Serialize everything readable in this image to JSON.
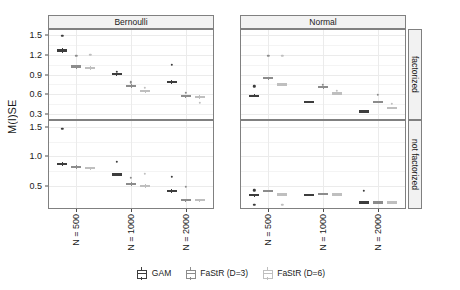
{
  "chart_data": {
    "type": "box",
    "title": "",
    "xlabel": "",
    "ylabel": "M(I)SE",
    "grid": true,
    "legend_position": "bottom",
    "facet_cols": [
      "Bernoulli",
      "Normal"
    ],
    "facet_rows": [
      "factorized",
      "not factorized"
    ],
    "categories": [
      "N = 500",
      "N = 1000",
      "N = 2000"
    ],
    "series": [
      {
        "name": "GAM",
        "color": "#3d3d3d"
      },
      {
        "name": "FaStR (D=3)",
        "color": "#8c8c8c"
      },
      {
        "name": "FaStR (D=6)",
        "color": "#bfbfbf"
      }
    ],
    "panels": [
      {
        "facet_col": "Bernoulli",
        "facet_row": "factorized",
        "ylim": [
          0.22,
          1.58
        ],
        "yticks": [
          0.3,
          0.6,
          0.9,
          1.2,
          1.5
        ],
        "ytick_labels": [
          "0.3",
          "0.6",
          "0.9",
          "1.2",
          "1.5"
        ],
        "boxes": [
          {
            "category": "N = 500",
            "series": "GAM",
            "q1": 1.25,
            "median": 1.27,
            "q3": 1.29,
            "lower": 1.24,
            "upper": 1.3,
            "outliers": [
              1.49
            ]
          },
          {
            "category": "N = 500",
            "series": "FaStR (D=3)",
            "q1": 1.0,
            "median": 1.02,
            "q3": 1.04,
            "lower": 0.99,
            "upper": 1.05,
            "outliers": [
              1.19
            ]
          },
          {
            "category": "N = 500",
            "series": "FaStR (D=6)",
            "q1": 0.99,
            "median": 1.0,
            "q3": 1.02,
            "lower": 0.98,
            "upper": 1.03,
            "outliers": [
              1.2
            ]
          },
          {
            "category": "N = 1000",
            "series": "GAM",
            "q1": 0.89,
            "median": 0.905,
            "q3": 0.92,
            "lower": 0.88,
            "upper": 0.93,
            "outliers": [
              0.94
            ]
          },
          {
            "category": "N = 1000",
            "series": "FaStR (D=3)",
            "q1": 0.715,
            "median": 0.73,
            "q3": 0.745,
            "lower": 0.71,
            "upper": 0.75,
            "outliers": [
              0.78
            ]
          },
          {
            "category": "N = 1000",
            "series": "FaStR (D=6)",
            "q1": 0.635,
            "median": 0.65,
            "q3": 0.665,
            "lower": 0.63,
            "upper": 0.67,
            "outliers": [
              0.7
            ]
          },
          {
            "category": "N = 2000",
            "series": "GAM",
            "q1": 0.77,
            "median": 0.785,
            "q3": 0.8,
            "lower": 0.76,
            "upper": 0.81,
            "outliers": [
              1.05
            ]
          },
          {
            "category": "N = 2000",
            "series": "FaStR (D=3)",
            "q1": 0.55,
            "median": 0.565,
            "q3": 0.58,
            "lower": 0.54,
            "upper": 0.59,
            "outliers": [
              0.62
            ]
          },
          {
            "category": "N = 2000",
            "series": "FaStR (D=6)",
            "q1": 0.545,
            "median": 0.56,
            "q3": 0.575,
            "lower": 0.54,
            "upper": 0.58,
            "outliers": [
              0.47
            ]
          }
        ]
      },
      {
        "facet_col": "Normal",
        "facet_row": "factorized",
        "ylim": [
          0.22,
          1.58
        ],
        "yticks": [
          0.3,
          0.6,
          0.9,
          1.2,
          1.5
        ],
        "ytick_labels": [
          "0.3",
          "0.6",
          "0.9",
          "1.2",
          "1.5"
        ],
        "boxes": [
          {
            "category": "N = 500",
            "series": "GAM",
            "q1": 0.565,
            "median": 0.575,
            "q3": 0.59,
            "lower": 0.555,
            "upper": 0.6,
            "outliers": [
              0.72
            ]
          },
          {
            "category": "N = 500",
            "series": "FaStR (D=3)",
            "q1": 0.825,
            "median": 0.84,
            "q3": 0.855,
            "lower": 0.82,
            "upper": 0.865,
            "outliers": [
              1.185
            ]
          },
          {
            "category": "N = 500",
            "series": "FaStR (D=6)",
            "q1": 0.74,
            "median": 0.75,
            "q3": 0.76,
            "lower": 0.735,
            "upper": 0.77,
            "outliers": [
              1.185
            ]
          },
          {
            "category": "N = 1000",
            "series": "GAM",
            "q1": 0.475,
            "median": 0.485,
            "q3": 0.495,
            "lower": 0.465,
            "upper": 0.5,
            "outliers": []
          },
          {
            "category": "N = 1000",
            "series": "FaStR (D=3)",
            "q1": 0.7,
            "median": 0.71,
            "q3": 0.72,
            "lower": 0.695,
            "upper": 0.725,
            "outliers": [
              0.74
            ]
          },
          {
            "category": "N = 1000",
            "series": "FaStR (D=6)",
            "q1": 0.6,
            "median": 0.61,
            "q3": 0.62,
            "lower": 0.595,
            "upper": 0.625,
            "outliers": [
              0.65
            ]
          },
          {
            "category": "N = 2000",
            "series": "GAM",
            "q1": 0.325,
            "median": 0.335,
            "q3": 0.345,
            "lower": 0.32,
            "upper": 0.35,
            "outliers": []
          },
          {
            "category": "N = 2000",
            "series": "FaStR (D=3)",
            "q1": 0.475,
            "median": 0.485,
            "q3": 0.495,
            "lower": 0.47,
            "upper": 0.5,
            "outliers": [
              0.59
            ]
          },
          {
            "category": "N = 2000",
            "series": "FaStR (D=6)",
            "q1": 0.385,
            "median": 0.395,
            "q3": 0.405,
            "lower": 0.38,
            "upper": 0.41,
            "outliers": [
              0.45
            ]
          }
        ]
      },
      {
        "facet_col": "Bernoulli",
        "facet_row": "not factorized",
        "ylim": [
          0.12,
          1.6
        ],
        "yticks": [
          0.5,
          1.0,
          1.5
        ],
        "ytick_labels": [
          "0.5",
          "1.0",
          "1.5"
        ],
        "boxes": [
          {
            "category": "N = 500",
            "series": "GAM",
            "q1": 0.86,
            "median": 0.875,
            "q3": 0.89,
            "lower": 0.85,
            "upper": 0.9,
            "outliers": [
              1.47
            ]
          },
          {
            "category": "N = 500",
            "series": "FaStR (D=3)",
            "q1": 0.8,
            "median": 0.815,
            "q3": 0.83,
            "lower": 0.79,
            "upper": 0.845,
            "outliers": []
          },
          {
            "category": "N = 500",
            "series": "FaStR (D=6)",
            "q1": 0.79,
            "median": 0.8,
            "q3": 0.815,
            "lower": 0.78,
            "upper": 0.825,
            "outliers": []
          },
          {
            "category": "N = 1000",
            "series": "GAM",
            "q1": 0.675,
            "median": 0.69,
            "q3": 0.705,
            "lower": 0.665,
            "upper": 0.715,
            "outliers": [
              0.91
            ]
          },
          {
            "category": "N = 1000",
            "series": "FaStR (D=3)",
            "q1": 0.515,
            "median": 0.53,
            "q3": 0.545,
            "lower": 0.505,
            "upper": 0.555,
            "outliers": [
              0.63
            ]
          },
          {
            "category": "N = 1000",
            "series": "FaStR (D=6)",
            "q1": 0.485,
            "median": 0.495,
            "q3": 0.51,
            "lower": 0.475,
            "upper": 0.52,
            "outliers": [
              0.7
            ]
          },
          {
            "category": "N = 2000",
            "series": "GAM",
            "q1": 0.395,
            "median": 0.41,
            "q3": 0.425,
            "lower": 0.385,
            "upper": 0.435,
            "outliers": [
              0.655
            ]
          },
          {
            "category": "N = 2000",
            "series": "FaStR (D=3)",
            "q1": 0.245,
            "median": 0.26,
            "q3": 0.275,
            "lower": 0.24,
            "upper": 0.28,
            "outliers": [
              0.485
            ]
          },
          {
            "category": "N = 2000",
            "series": "FaStR (D=6)",
            "q1": 0.245,
            "median": 0.255,
            "q3": 0.265,
            "lower": 0.24,
            "upper": 0.275,
            "outliers": []
          }
        ]
      },
      {
        "facet_col": "Normal",
        "facet_row": "not factorized",
        "ylim": [
          0.12,
          1.6
        ],
        "yticks": [
          0.5,
          1.0,
          1.5
        ],
        "ytick_labels": [
          "0.5",
          "1.0",
          "1.5"
        ],
        "boxes": [
          {
            "category": "N = 500",
            "series": "GAM",
            "q1": 0.33,
            "median": 0.34,
            "q3": 0.35,
            "lower": 0.325,
            "upper": 0.355,
            "outliers": [
              0.42,
              0.17
            ]
          },
          {
            "category": "N = 500",
            "series": "FaStR (D=3)",
            "q1": 0.405,
            "median": 0.415,
            "q3": 0.425,
            "lower": 0.4,
            "upper": 0.43,
            "outliers": []
          },
          {
            "category": "N = 500",
            "series": "FaStR (D=6)",
            "q1": 0.345,
            "median": 0.355,
            "q3": 0.365,
            "lower": 0.34,
            "upper": 0.37,
            "outliers": [
              0.17
            ]
          },
          {
            "category": "N = 1000",
            "series": "GAM",
            "q1": 0.335,
            "median": 0.345,
            "q3": 0.355,
            "lower": 0.33,
            "upper": 0.36,
            "outliers": []
          },
          {
            "category": "N = 1000",
            "series": "FaStR (D=3)",
            "q1": 0.355,
            "median": 0.365,
            "q3": 0.375,
            "lower": 0.35,
            "upper": 0.38,
            "outliers": []
          },
          {
            "category": "N = 1000",
            "series": "FaStR (D=6)",
            "q1": 0.345,
            "median": 0.355,
            "q3": 0.365,
            "lower": 0.34,
            "upper": 0.37,
            "outliers": []
          },
          {
            "category": "N = 2000",
            "series": "GAM",
            "q1": 0.205,
            "median": 0.215,
            "q3": 0.225,
            "lower": 0.2,
            "upper": 0.23,
            "outliers": [
              0.41
            ]
          },
          {
            "category": "N = 2000",
            "series": "FaStR (D=3)",
            "q1": 0.205,
            "median": 0.215,
            "q3": 0.225,
            "lower": 0.2,
            "upper": 0.23,
            "outliers": []
          },
          {
            "category": "N = 2000",
            "series": "FaStR (D=6)",
            "q1": 0.205,
            "median": 0.215,
            "q3": 0.225,
            "lower": 0.2,
            "upper": 0.23,
            "outliers": []
          }
        ]
      }
    ]
  },
  "legend": {
    "items": [
      {
        "label": "GAM"
      },
      {
        "label": "FaStR (D=3)"
      },
      {
        "label": "FaStR (D=6)"
      }
    ]
  }
}
